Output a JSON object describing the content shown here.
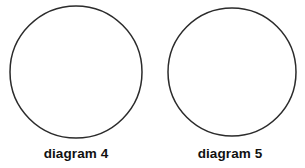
{
  "page": {
    "background_color": "#ffffff",
    "width": 305,
    "height": 168
  },
  "style": {
    "stroke_color": "#2b2b2b",
    "fill_color": "#ffffff",
    "caption_color": "#111111"
  },
  "figures": [
    {
      "shape": "circle",
      "caption": "diagram 4",
      "center_x": 76,
      "center_y": 72,
      "radius": 66,
      "fill": "none",
      "stroke": "#2b2b2b",
      "stroke_width": 1.5
    },
    {
      "shape": "circle",
      "caption": "diagram 5",
      "center_x": 77,
      "center_y": 72,
      "radius": 64,
      "fill": "none",
      "stroke": "#2b2b2b",
      "stroke_width": 1.5
    }
  ]
}
